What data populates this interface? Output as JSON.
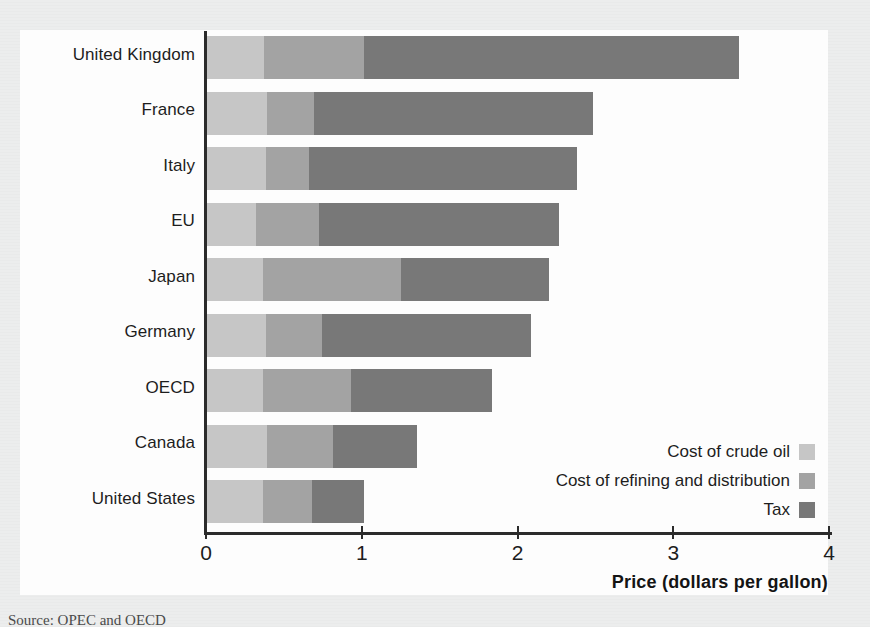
{
  "chart_data": {
    "type": "bar",
    "orientation": "horizontal",
    "stacked": true,
    "title": "",
    "xlabel": "Price (dollars per gallon)",
    "ylabel": "",
    "xlim": [
      0,
      4
    ],
    "xticks": [
      0,
      1,
      2,
      3,
      4
    ],
    "xtick_labels": [
      "0",
      "1",
      "2",
      "3",
      "4"
    ],
    "grid": false,
    "legend_position": "inside-bottom-right",
    "categories": [
      "United Kingdom",
      "France",
      "Italy",
      "EU",
      "Japan",
      "Germany",
      "OECD",
      "Canada",
      "United States"
    ],
    "series": [
      {
        "name": "Cost of crude oil",
        "color": "#c6c6c6",
        "values": [
          0.38,
          0.4,
          0.39,
          0.33,
          0.37,
          0.39,
          0.37,
          0.4,
          0.37
        ]
      },
      {
        "name": "Cost of refining and distribution",
        "color": "#a3a3a3",
        "values": [
          0.64,
          0.3,
          0.28,
          0.4,
          0.89,
          0.36,
          0.57,
          0.42,
          0.32
        ]
      },
      {
        "name": "Tax",
        "color": "#787878",
        "values": [
          2.41,
          1.79,
          1.72,
          1.54,
          0.95,
          1.34,
          0.9,
          0.54,
          0.33
        ]
      }
    ],
    "totals": [
      3.43,
      2.49,
      2.39,
      2.27,
      2.21,
      2.09,
      1.84,
      1.36,
      1.02
    ]
  },
  "legend": {
    "items": [
      {
        "label": "Cost of crude oil",
        "color": "#c6c6c6"
      },
      {
        "label": "Cost of refining and distribution",
        "color": "#a3a3a3"
      },
      {
        "label": "Tax",
        "color": "#787878"
      }
    ]
  },
  "axis": {
    "x_title": "Price (dollars per gallon)",
    "x_tick_labels": [
      "0",
      "1",
      "2",
      "3",
      "4"
    ]
  },
  "caption": {
    "source": "Source:  OPEC and OECD"
  }
}
